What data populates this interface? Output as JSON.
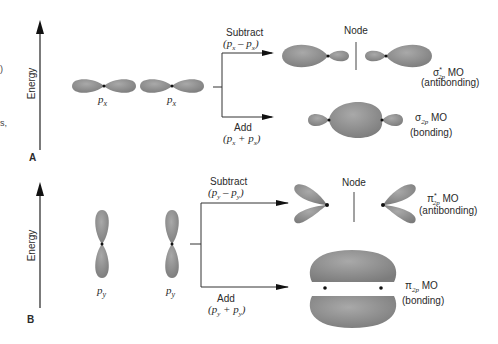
{
  "colors": {
    "orbital": "#8a8a8a",
    "orbital_highlight": "#a8a8a8",
    "line": "#333333",
    "nucleus": "#111111"
  },
  "left_margin_fragments": [
    ")",
    "s,"
  ],
  "panel_a": {
    "letter": "A",
    "axis_label": "Energy",
    "atomic_orbitals": [
      {
        "label_base": "p",
        "label_sub": "x"
      },
      {
        "label_base": "p",
        "label_sub": "x"
      }
    ],
    "subtract": {
      "label": "Subtract",
      "expr": "(p",
      "expr_sub1": "x",
      "expr_op": " – p",
      "expr_sub2": "x",
      "expr_close": ")"
    },
    "add": {
      "label": "Add",
      "expr": "(p",
      "expr_sub1": "x",
      "expr_op": " + p",
      "expr_sub2": "x",
      "expr_close": ")"
    },
    "node_label": "Node",
    "antibonding": {
      "symbol": "σ",
      "star": "*",
      "sub": "2p",
      "mo": " MO",
      "desc": "(antibonding)"
    },
    "bonding": {
      "symbol": "σ",
      "sub": "2p",
      "mo": " MO",
      "desc": "(bonding)"
    }
  },
  "panel_b": {
    "letter": "B",
    "axis_label": "Energy",
    "atomic_orbitals": [
      {
        "label_base": "p",
        "label_sub": "y"
      },
      {
        "label_base": "p",
        "label_sub": "y"
      }
    ],
    "subtract": {
      "label": "Subtract",
      "expr": "(p",
      "expr_sub1": "y",
      "expr_op": " – p",
      "expr_sub2": "y",
      "expr_close": ")"
    },
    "add": {
      "label": "Add",
      "expr": "(p",
      "expr_sub1": "y",
      "expr_op": " + p",
      "expr_sub2": "y",
      "expr_close": ")"
    },
    "node_label": "Node",
    "antibonding": {
      "symbol": "π",
      "star": "*",
      "sub": "2p",
      "mo": " MO",
      "desc": "(antibonding)"
    },
    "bonding": {
      "symbol": "π",
      "sub": "2p",
      "mo": " MO",
      "desc": "(bonding)"
    }
  }
}
